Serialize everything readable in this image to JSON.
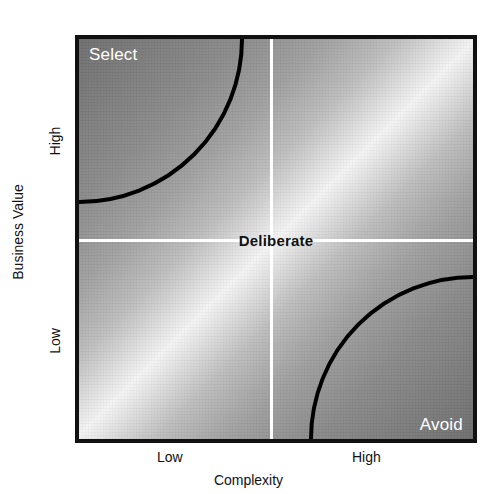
{
  "chart_data": {
    "type": "scatter",
    "title": "",
    "xlabel": "Complexity",
    "ylabel": "Business Value",
    "x_ticks": [
      "Low",
      "High"
    ],
    "y_ticks": [
      "Low",
      "High"
    ],
    "grid": false,
    "legend": "none",
    "quadrant_labels": [
      {
        "name": "select",
        "text": "Select",
        "position": "top-left",
        "color": "#ffffff"
      },
      {
        "name": "deliberate",
        "text": "Deliberate",
        "position": "center",
        "color": "#111111"
      },
      {
        "name": "avoid",
        "text": "Avoid",
        "position": "bottom-right",
        "color": "#ffffff"
      }
    ],
    "regions": [
      {
        "name": "Select",
        "x_range": "Low",
        "y_range": "High",
        "shading": "dark",
        "boundary": "quarter-arc"
      },
      {
        "name": "Deliberate",
        "x_range": "Mid",
        "y_range": "Mid",
        "shading": "light",
        "boundary": "crosshair"
      },
      {
        "name": "Avoid",
        "x_range": "High",
        "y_range": "Low",
        "shading": "dark",
        "boundary": "quarter-arc"
      }
    ],
    "background": "diagonal greyscale gradient, dark at top-left and bottom-right, bright along the anti-diagonal",
    "annotations": [
      "Select",
      "Deliberate",
      "Avoid"
    ]
  },
  "figure": {
    "x_axis": {
      "title": "Complexity",
      "tick_low": "Low",
      "tick_high": "High"
    },
    "y_axis": {
      "title": "Business Value",
      "tick_low": "Low",
      "tick_high": "High"
    },
    "labels": {
      "select": "Select",
      "deliberate": "Deliberate",
      "avoid": "Avoid"
    },
    "colors": {
      "border": "#111111",
      "arc": "#000000",
      "crosshair": "#ffffff",
      "label_light": "#ffffff",
      "label_dark": "#111111",
      "gradient_dark": "#6f6f6f",
      "gradient_light": "#f4f4f4"
    }
  }
}
